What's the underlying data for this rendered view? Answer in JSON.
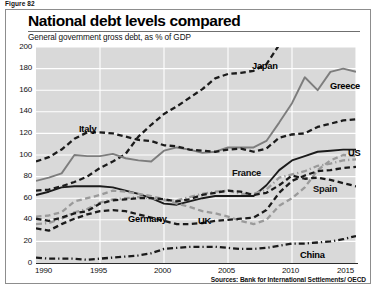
{
  "figure_label": "Figure 82",
  "source_note": "Sources: Bank for International Settlements/ OECD",
  "colors": {
    "plot_background": "#d9d9d9",
    "gridline": "#ffffff",
    "dark_line": "#1b1b1b",
    "gray_line": "#7d7d7d",
    "axis": "#2b2b2b",
    "frame": "#8d8d8d"
  },
  "chart_data": {
    "type": "line",
    "title": "National debt levels compared",
    "subtitle": "General government gross debt, as % of GDP",
    "xlabel": "",
    "ylabel": "",
    "grid": true,
    "legend_position": "inline-labels",
    "xlim": [
      1990,
      2015
    ],
    "ylim": [
      0,
      200
    ],
    "yticks": [
      0,
      20,
      40,
      60,
      80,
      100,
      120,
      140,
      160,
      180,
      200
    ],
    "xticks": [
      1990,
      1995,
      2000,
      2005,
      2010,
      2015
    ],
    "x": [
      1990,
      1991,
      1992,
      1993,
      1994,
      1995,
      1996,
      1997,
      1998,
      1999,
      2000,
      2001,
      2002,
      2003,
      2004,
      2005,
      2006,
      2007,
      2008,
      2009,
      2010,
      2011,
      2012,
      2013,
      2014,
      2015
    ],
    "series": [
      {
        "name": "Japan",
        "style": "dashed",
        "color": "#1b1b1b",
        "label_x": 252,
        "label_y": 61,
        "values": [
          67,
          68,
          71,
          75,
          80,
          88,
          94,
          101,
          117,
          128,
          138,
          145,
          153,
          161,
          171,
          175,
          176,
          178,
          184,
          202,
          208,
          220,
          228,
          233,
          242,
          248
        ]
      },
      {
        "name": "Greece",
        "style": "solid",
        "color": "#7d7d7d",
        "label_x": 330,
        "label_y": 81,
        "values": [
          76,
          79,
          83,
          100,
          99,
          99,
          101,
          97,
          95,
          94,
          104,
          107,
          105,
          102,
          103,
          107,
          107,
          107,
          113,
          130,
          148,
          172,
          160,
          177,
          180,
          177
        ]
      },
      {
        "name": "Italy",
        "style": "dashed",
        "color": "#1b1b1b",
        "label_x": 79,
        "label_y": 124,
        "values": [
          94,
          98,
          105,
          115,
          121,
          121,
          120,
          117,
          114,
          113,
          109,
          108,
          105,
          104,
          103,
          105,
          106,
          103,
          106,
          116,
          119,
          120,
          126,
          129,
          132,
          133
        ]
      },
      {
        "name": "US",
        "style": "solid",
        "color": "#1b1b1b",
        "label_x": 348,
        "label_y": 148,
        "values": [
          63,
          66,
          70,
          71,
          71,
          71,
          70,
          67,
          64,
          60,
          55,
          54,
          57,
          60,
          62,
          62,
          62,
          62,
          72,
          86,
          95,
          99,
          103,
          104,
          105,
          105
        ]
      },
      {
        "name": "France",
        "style": "dash-dot",
        "color": "#9a9a9a",
        "label_x": 232,
        "label_y": 168,
        "values": [
          36,
          37,
          41,
          47,
          50,
          56,
          59,
          60,
          61,
          60,
          58,
          58,
          61,
          64,
          66,
          67,
          64,
          64,
          68,
          79,
          82,
          85,
          90,
          92,
          95,
          96
        ]
      },
      {
        "name": "Spain",
        "style": "dashed",
        "color": "#9a9a9a",
        "label_x": 313,
        "label_y": 184,
        "values": [
          43,
          44,
          47,
          57,
          60,
          63,
          67,
          66,
          64,
          62,
          59,
          55,
          52,
          48,
          46,
          43,
          39,
          36,
          40,
          53,
          60,
          70,
          86,
          95,
          100,
          99
        ]
      },
      {
        "name": "Germany",
        "style": "dashed",
        "color": "#1b1b1b",
        "label_x": 128,
        "label_y": 214,
        "values": [
          41,
          39,
          42,
          46,
          48,
          55,
          58,
          59,
          60,
          60,
          59,
          57,
          59,
          63,
          65,
          67,
          66,
          63,
          65,
          72,
          81,
          78,
          79,
          77,
          74,
          71
        ]
      },
      {
        "name": "UK",
        "style": "dashed",
        "color": "#1b1b1b",
        "label_x": 198,
        "label_y": 216,
        "values": [
          32,
          30,
          36,
          41,
          45,
          48,
          49,
          48,
          45,
          42,
          39,
          36,
          36,
          37,
          39,
          40,
          41,
          42,
          49,
          65,
          76,
          81,
          85,
          86,
          88,
          89
        ]
      },
      {
        "name": "China",
        "style": "dash-dot",
        "color": "#1b1b1b",
        "label_x": 300,
        "label_y": 250,
        "values": [
          5,
          4,
          4,
          4,
          3,
          4,
          5,
          6,
          7,
          9,
          13,
          14,
          15,
          15,
          15,
          14,
          13,
          13,
          14,
          16,
          18,
          18,
          19,
          20,
          22,
          25
        ]
      }
    ]
  }
}
